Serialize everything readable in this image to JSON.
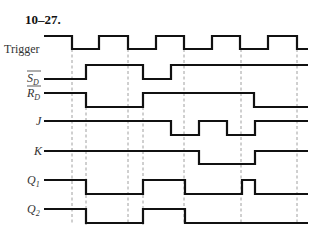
{
  "title": "10–27.",
  "x_start": 44,
  "x_end": 308,
  "signals": [
    {
      "id": "trigger",
      "label": "Trigger",
      "label_style": "plain",
      "overbar": false,
      "sub": "",
      "y_high": 36,
      "y_low": 49,
      "label_x": 4,
      "label_y": 53,
      "initial": 1,
      "edges": [
        72,
        99,
        128,
        156,
        184,
        212,
        240,
        268,
        297
      ]
    },
    {
      "id": "sd-bar",
      "label": "S",
      "label_style": "italic",
      "overbar": true,
      "sub": "D",
      "y_high": 65,
      "y_low": 79,
      "label_x": 27,
      "label_y": 82,
      "initial": 0,
      "edges": [
        86,
        143,
        171
      ]
    },
    {
      "id": "rd-bar",
      "label": "R",
      "label_style": "italic",
      "overbar": true,
      "sub": "D",
      "y_high": 93,
      "y_low": 107,
      "label_x": 27,
      "label_y": 97,
      "initial": 1,
      "edges": [
        86,
        143,
        254
      ]
    },
    {
      "id": "j",
      "label": "J",
      "label_style": "italic",
      "overbar": false,
      "sub": "",
      "y_high": 121,
      "y_low": 135,
      "label_x": 36,
      "label_y": 125,
      "initial": 1,
      "edges": [
        171,
        199,
        227,
        255
      ]
    },
    {
      "id": "k",
      "label": "K",
      "label_style": "italic",
      "overbar": false,
      "sub": "",
      "y_high": 151,
      "y_low": 164,
      "label_x": 34,
      "label_y": 155,
      "initial": 1,
      "edges": [
        199,
        255
      ]
    },
    {
      "id": "q1",
      "label": "Q",
      "label_style": "italic",
      "overbar": false,
      "sub": "1",
      "y_high": 180,
      "y_low": 194,
      "label_x": 27,
      "label_y": 184,
      "initial": 1,
      "edges": [
        86,
        143,
        185,
        242,
        255
      ]
    },
    {
      "id": "q2",
      "label": "Q",
      "label_style": "italic",
      "overbar": false,
      "sub": "2",
      "y_high": 209,
      "y_low": 223,
      "label_x": 27,
      "label_y": 213,
      "initial": 1,
      "edges": [
        86,
        143,
        185
      ]
    }
  ],
  "guides": [
    {
      "x": 72,
      "y1": 49,
      "y2": 224
    },
    {
      "x": 86,
      "y1": 107,
      "y2": 225
    },
    {
      "x": 128,
      "y1": 49,
      "y2": 224
    },
    {
      "x": 143,
      "y1": 107,
      "y2": 225
    },
    {
      "x": 184,
      "y1": 49,
      "y2": 224
    },
    {
      "x": 241,
      "y1": 49,
      "y2": 224
    },
    {
      "x": 297,
      "y1": 49,
      "y2": 224
    }
  ]
}
